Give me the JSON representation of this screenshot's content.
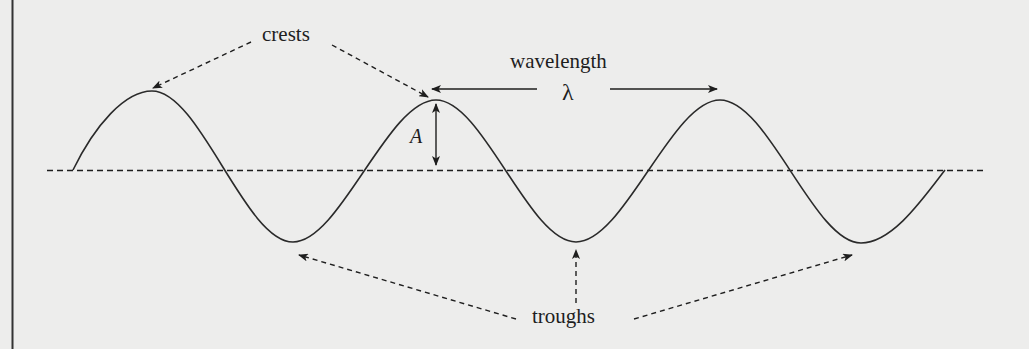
{
  "diagram": {
    "type": "transverse-wave",
    "labels": {
      "crests": "crests",
      "wavelength": "wavelength",
      "lambda": "λ",
      "amplitude": "A",
      "troughs": "troughs"
    },
    "colors": {
      "background": "#ededec",
      "ink": "#1e1e1e",
      "border": "#333333"
    },
    "wave": {
      "baseline_y": 170,
      "start_x": 73,
      "end_x": 945,
      "crests": [
        {
          "x": 152,
          "y": 91
        },
        {
          "x": 436,
          "y": 100
        },
        {
          "x": 720,
          "y": 100
        }
      ],
      "troughs": [
        {
          "x": 293,
          "y": 242
        },
        {
          "x": 576,
          "y": 242
        },
        {
          "x": 861,
          "y": 243
        }
      ]
    },
    "annotations": [
      {
        "name": "crests-pointer",
        "points_to": [
          "crest-1",
          "crest-2"
        ],
        "style": "dashed-arrow"
      },
      {
        "name": "wavelength-arrow",
        "from": "crest-2",
        "to": "crest-3",
        "style": "solid-double-arrow"
      },
      {
        "name": "amplitude-arrow",
        "from": "baseline",
        "to": "crest-2",
        "style": "solid-double-arrow"
      },
      {
        "name": "troughs-pointer",
        "points_to": [
          "trough-1",
          "trough-2",
          "trough-3"
        ],
        "style": "dashed-arrow"
      }
    ]
  }
}
